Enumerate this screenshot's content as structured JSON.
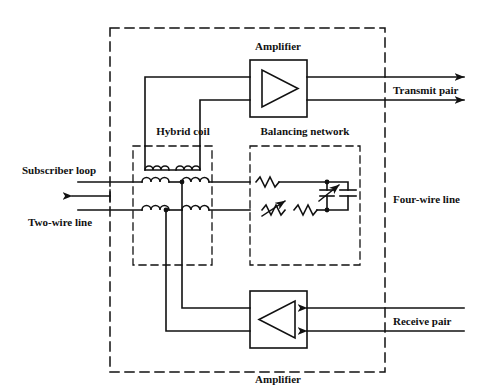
{
  "figure": {
    "type": "schematic-diagram"
  },
  "colors": {
    "ink": "#111111",
    "background": "#ffffff",
    "dashed": "#222222"
  },
  "labels": {
    "amplifier_top": "Amplifier",
    "amplifier_bottom": "Amplifier",
    "hybrid_coil": "Hybrid coil",
    "balancing_network": "Balancing network",
    "subscriber_loop": "Subscriber loop",
    "two_wire_line": "Two-wire line",
    "four_wire_line": "Four-wire line",
    "transmit_pair": "Transmit pair",
    "receive_pair": "Receive pair"
  },
  "components": {
    "amplifier_top": {
      "name": "Amplifier",
      "symbol": "triangle-right",
      "direction": "outgoing",
      "box": {
        "x": 250,
        "y": 60,
        "w": 57,
        "h": 57
      }
    },
    "amplifier_bottom": {
      "name": "Amplifier",
      "symbol": "triangle-left",
      "direction": "incoming",
      "box": {
        "x": 250,
        "y": 291,
        "w": 57,
        "h": 57
      }
    },
    "hybrid_coil": {
      "name": "Hybrid coil",
      "windings": 4,
      "box": {
        "x": 133,
        "y": 146,
        "w": 79,
        "h": 119
      }
    },
    "balancing_network": {
      "name": "Balancing network",
      "elements": [
        "resistor",
        "variable-resistor",
        "resistor",
        "variable-capacitor",
        "capacitor"
      ],
      "box": {
        "x": 250,
        "y": 146,
        "w": 110,
        "h": 119
      }
    },
    "outer_boundary": {
      "name": "terminating-set-boundary",
      "box": {
        "x": 110,
        "y": 28,
        "w": 275,
        "h": 344
      }
    }
  },
  "ports": {
    "transmit_pair": {
      "label": "Transmit pair",
      "arrow": "right",
      "wires": 2
    },
    "receive_pair": {
      "label": "Receive pair",
      "arrow": "left",
      "wires": 2
    },
    "two_wire_line": {
      "label": "Two-wire line",
      "arrow": "left",
      "wires": 2
    },
    "four_wire_line": {
      "label": "Four-wire line",
      "wires": 4
    }
  }
}
